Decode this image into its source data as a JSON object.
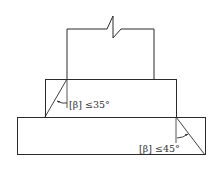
{
  "diagram": {
    "colors": {
      "line": "#2b2b2b",
      "background": "#ffffff",
      "text": "#333333"
    },
    "blocks": [
      {
        "name": "column",
        "x": 67,
        "y": 29,
        "w": 87,
        "h": 50,
        "break_line": true
      },
      {
        "name": "upper-step",
        "x": 45,
        "y": 79,
        "w": 131,
        "h": 38
      },
      {
        "name": "lower-step",
        "x": 17,
        "y": 117,
        "w": 188,
        "h": 38
      }
    ],
    "angle_labels": {
      "upper": "[β] ≤35°",
      "lower": "[β] ≤45°"
    }
  }
}
